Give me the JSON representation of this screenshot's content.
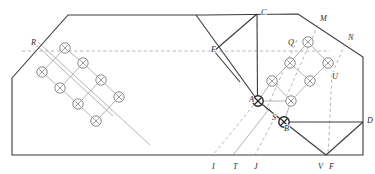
{
  "figure": {
    "background_color": "#ffffff",
    "stroke_color": "#3a3a3a",
    "thin_stroke_color": "#8b8b8b",
    "dashed_stroke_color": "#9a9a9a",
    "width": 375,
    "height": 174
  },
  "outline": {
    "name": "hexagonal-boundary",
    "points": "12,78 68,15 205,15 298,14 363,57 363,155 12,155",
    "closed": true
  },
  "labels": [
    {
      "id": "R",
      "text": "R",
      "x": 31,
      "y": 45
    },
    {
      "id": "C",
      "text": "C",
      "x": 261,
      "y": 15
    },
    {
      "id": "E",
      "text": "E",
      "x": 211,
      "y": 52
    },
    {
      "id": "M",
      "text": "M",
      "x": 320,
      "y": 21
    },
    {
      "id": "N",
      "text": "N",
      "x": 348,
      "y": 40
    },
    {
      "id": "Q",
      "text": "Q",
      "x": 288,
      "y": 45
    },
    {
      "id": "U",
      "text": "U",
      "x": 332,
      "y": 79
    },
    {
      "id": "A",
      "text": "A",
      "x": 249,
      "y": 102
    },
    {
      "id": "S",
      "text": "S",
      "x": 272,
      "y": 120
    },
    {
      "id": "B",
      "text": "B",
      "x": 284,
      "y": 131
    },
    {
      "id": "D",
      "text": "D",
      "x": 367,
      "y": 123
    },
    {
      "id": "I",
      "text": "I",
      "x": 212,
      "y": 169
    },
    {
      "id": "T",
      "text": "T",
      "x": 233,
      "y": 169
    },
    {
      "id": "J",
      "text": "J",
      "x": 254,
      "y": 169
    },
    {
      "id": "V",
      "text": "V",
      "x": 318,
      "y": 169
    },
    {
      "id": "F",
      "text": "F",
      "x": 329,
      "y": 169
    }
  ],
  "solid_lines": [
    {
      "id": "C-to-A-vertical",
      "x1": 257,
      "y1": 14,
      "x2": 257.5,
      "y2": 101
    },
    {
      "id": "C-to-E",
      "x1": 257,
      "y1": 14,
      "x2": 214,
      "y2": 51
    },
    {
      "id": "top-diag-long",
      "x1": 196,
      "y1": 15,
      "x2": 258,
      "y2": 101
    },
    {
      "id": "E-down-right",
      "x1": 214,
      "y1": 51,
      "x2": 240,
      "y2": 82
    },
    {
      "id": "A-to-B",
      "x1": 258,
      "y1": 101,
      "x2": 284,
      "y2": 122
    },
    {
      "id": "B-to-D",
      "x1": 284,
      "y1": 122,
      "x2": 363,
      "y2": 122
    },
    {
      "id": "B-to-V",
      "x1": 284,
      "y1": 122,
      "x2": 326,
      "y2": 155
    },
    {
      "id": "V-to-D",
      "x1": 326,
      "y1": 155,
      "x2": 363,
      "y2": 122
    }
  ],
  "dashed_lines": [
    {
      "id": "horizontal-guide",
      "x1": 22,
      "y1": 51,
      "x2": 330,
      "y2": 51
    },
    {
      "id": "A-to-I",
      "x1": 257,
      "y1": 101,
      "x2": 213,
      "y2": 155
    },
    {
      "id": "S-to-J",
      "x1": 275,
      "y1": 117,
      "x2": 255,
      "y2": 155
    },
    {
      "id": "U-to-F",
      "x1": 332,
      "y1": 74,
      "x2": 328,
      "y2": 155
    },
    {
      "id": "Q-diag-down",
      "x1": 297,
      "y1": 40,
      "x2": 266,
      "y2": 110
    },
    {
      "id": "M-diag-down",
      "x1": 318,
      "y1": 25,
      "x2": 287,
      "y2": 95
    },
    {
      "id": "N-diag-down",
      "x1": 345,
      "y1": 44,
      "x2": 333,
      "y2": 72
    }
  ],
  "thin_lines": [
    {
      "id": "left-lattice-axis-1",
      "x1": 38,
      "y1": 42,
      "x2": 150,
      "y2": 145
    },
    {
      "id": "left-lattice-axis-2",
      "x1": 35,
      "y1": 44,
      "x2": 113,
      "y2": 116
    },
    {
      "id": "T-slant",
      "x1": 270,
      "y1": 108,
      "x2": 233,
      "y2": 155
    }
  ],
  "left_lattice": {
    "name": "left-circle-lattice",
    "nodes": [
      {
        "x": 65,
        "y": 48
      },
      {
        "x": 42,
        "y": 72
      },
      {
        "x": 83,
        "y": 63
      },
      {
        "x": 60,
        "y": 88
      },
      {
        "x": 101,
        "y": 80
      },
      {
        "x": 78,
        "y": 104
      },
      {
        "x": 119,
        "y": 97
      },
      {
        "x": 96,
        "y": 121
      }
    ],
    "radius": 5.2
  },
  "right_lattice": {
    "name": "right-circle-lattice",
    "nodes": [
      {
        "x": 308,
        "y": 42
      },
      {
        "x": 290,
        "y": 63
      },
      {
        "x": 328,
        "y": 63
      },
      {
        "x": 272,
        "y": 81
      },
      {
        "x": 310,
        "y": 81
      },
      {
        "x": 291,
        "y": 101
      },
      {
        "x": 258,
        "y": 101
      },
      {
        "x": 284,
        "y": 122
      }
    ],
    "radius": 5.2,
    "bold_nodes": [
      "A",
      "B"
    ]
  },
  "meta": {
    "symbol_name": "circled-cross",
    "symbol_count_left": 8,
    "symbol_count_right": 8
  }
}
